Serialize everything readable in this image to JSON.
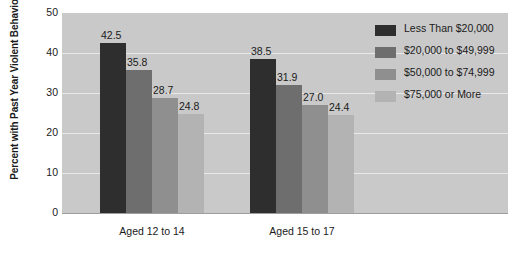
{
  "chart_data": {
    "type": "bar",
    "title": "",
    "xlabel": "",
    "ylabel": "Percent with Past Year Violent Behavior",
    "ylim": [
      0,
      50
    ],
    "yticks": [
      0,
      10,
      20,
      30,
      40,
      50
    ],
    "grid": true,
    "legend_position": "right",
    "categories": [
      "Aged 12 to 14",
      "Aged 15 to 17"
    ],
    "series": [
      {
        "name": "Less Than $20,000",
        "color": "#2e2e2e",
        "values": [
          42.5,
          38.5
        ],
        "labels": [
          "42.5",
          "38.5"
        ]
      },
      {
        "name": "$20,000 to $49,999",
        "color": "#6e6e6e",
        "values": [
          35.8,
          31.9
        ],
        "labels": [
          "35.8",
          "31.9"
        ]
      },
      {
        "name": "$50,000 to $74,999",
        "color": "#8f8f8f",
        "values": [
          28.7,
          27.0
        ],
        "labels": [
          "28.7",
          "27.0"
        ]
      },
      {
        "name": "$75,000 or More",
        "color": "#b3b3b3",
        "values": [
          24.8,
          24.4
        ],
        "labels": [
          "24.8",
          "24.4"
        ]
      }
    ],
    "plot_background": "#c9c9c9",
    "gridline_color": "#e9e9e9",
    "axis_color": "#9e9e9e",
    "text_color": "#1a1a1a"
  }
}
